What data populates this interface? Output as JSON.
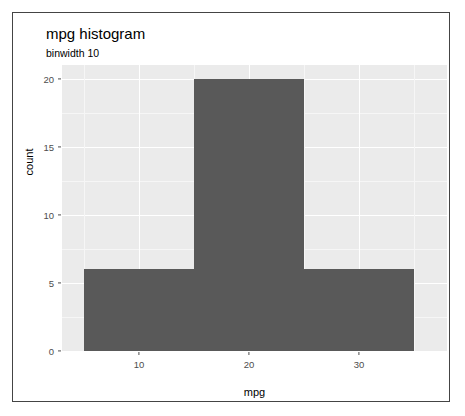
{
  "chart_data": {
    "type": "bar",
    "title": "mpg histogram",
    "subtitle": "binwidth 10",
    "xlabel": "mpg",
    "ylabel": "count",
    "binwidth": 10,
    "categories": [
      "5–15",
      "15–25",
      "25–35"
    ],
    "bin_edges": [
      5,
      15,
      25,
      35
    ],
    "values": [
      6,
      20,
      6
    ],
    "xlim": [
      3,
      38
    ],
    "ylim": [
      0,
      21
    ],
    "x_ticks": [
      10,
      20,
      30
    ],
    "x_tick_labels": [
      "10",
      "20",
      "30"
    ],
    "y_ticks": [
      0,
      5,
      10,
      15,
      20
    ],
    "y_tick_labels": [
      "0",
      "5",
      "10",
      "15",
      "20"
    ],
    "grid": true,
    "legend": null,
    "bar_color": "#595959",
    "panel_background": "#ebebeb",
    "gridline_color": "#ffffff"
  }
}
